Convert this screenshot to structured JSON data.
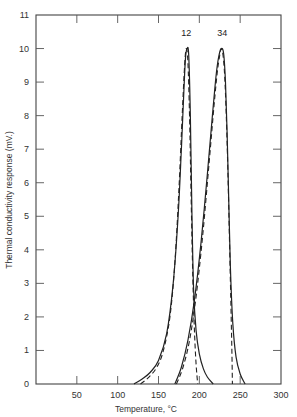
{
  "chart_data": {
    "type": "line",
    "title": "",
    "xlabel": "Temperature, °C",
    "ylabel": "Thermal conductivity response (mV.)",
    "xlim": [
      0,
      300
    ],
    "ylim": [
      0,
      11
    ],
    "x_ticks": [
      50,
      100,
      150,
      200,
      250,
      300
    ],
    "y_ticks": [
      0,
      1,
      2,
      3,
      4,
      5,
      6,
      7,
      8,
      9,
      10,
      11
    ],
    "grid": false,
    "legend": null,
    "annotations": [
      {
        "text": "12",
        "x": 184,
        "y": 10.3
      },
      {
        "text": "34",
        "x": 228,
        "y": 10.3
      }
    ],
    "series": [
      {
        "name": "1",
        "style": "solid",
        "x": [
          120,
          130,
          140,
          150,
          160,
          168,
          174,
          178,
          181,
          183,
          185,
          187,
          189,
          191,
          193,
          196,
          200,
          205,
          210,
          217
        ],
        "y": [
          0,
          0.15,
          0.35,
          0.7,
          1.5,
          3.0,
          5.0,
          7.0,
          8.7,
          9.7,
          10.0,
          9.8,
          8.0,
          5.0,
          2.8,
          1.6,
          0.9,
          0.45,
          0.2,
          0
        ]
      },
      {
        "name": "2",
        "style": "dashed",
        "x": [
          128,
          138,
          148,
          156,
          164,
          170,
          175,
          179,
          182,
          184,
          186,
          188,
          190,
          192,
          194,
          196,
          198
        ],
        "y": [
          0,
          0.2,
          0.5,
          1.0,
          2.0,
          3.6,
          5.8,
          8.0,
          9.5,
          10.0,
          9.6,
          8.0,
          5.5,
          3.2,
          1.6,
          0.6,
          0
        ]
      },
      {
        "name": "3",
        "style": "solid",
        "x": [
          170,
          178,
          186,
          194,
          202,
          210,
          216,
          221,
          225,
          228,
          230,
          232,
          234,
          236,
          238,
          241,
          245,
          250,
          256
        ],
        "y": [
          0,
          0.5,
          1.3,
          2.5,
          4.2,
          6.3,
          8.0,
          9.3,
          9.9,
          10.0,
          9.8,
          9.0,
          7.5,
          5.5,
          3.5,
          1.8,
          0.8,
          0.3,
          0
        ]
      },
      {
        "name": "4",
        "style": "dashed",
        "x": [
          172,
          180,
          188,
          196,
          204,
          212,
          218,
          222,
          225,
          227,
          229,
          231,
          233,
          235,
          237,
          239,
          240,
          240.5
        ],
        "y": [
          0,
          0.5,
          1.3,
          2.6,
          4.4,
          6.6,
          8.3,
          9.3,
          9.8,
          10.0,
          9.8,
          9.2,
          8.0,
          6.3,
          4.2,
          2.0,
          0.8,
          0
        ]
      }
    ]
  },
  "axes": {
    "xlabel": "Temperature, °C",
    "ylabel": "Thermal conductivity response (mV.)"
  }
}
